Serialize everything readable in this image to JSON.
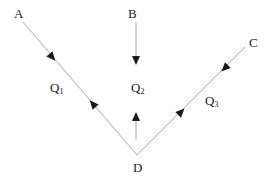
{
  "diagram": {
    "type": "flow-network",
    "colors": {
      "line": "#a8a8a8",
      "arrow": "#1a1a1a",
      "text": "#222222",
      "background": "#ffffff"
    },
    "nodes": [
      {
        "id": "A",
        "label": "A"
      },
      {
        "id": "B",
        "label": "B"
      },
      {
        "id": "C",
        "label": "C"
      },
      {
        "id": "D",
        "label": "D"
      }
    ],
    "flows": [
      {
        "id": "Q1",
        "label": "Q",
        "subscript": "1",
        "between": [
          "A",
          "D"
        ],
        "arrows": [
          "toward D (near A)",
          "toward A (near D)"
        ]
      },
      {
        "id": "Q2",
        "label": "Q",
        "subscript": "2",
        "between": [
          "B",
          "D"
        ],
        "arrows": [
          "B downward",
          "D upward"
        ]
      },
      {
        "id": "Q3",
        "label": "Q",
        "subscript": "3",
        "between": [
          "C",
          "D"
        ],
        "arrows": [
          "toward D (near C)",
          "toward C (near D)"
        ]
      }
    ]
  }
}
